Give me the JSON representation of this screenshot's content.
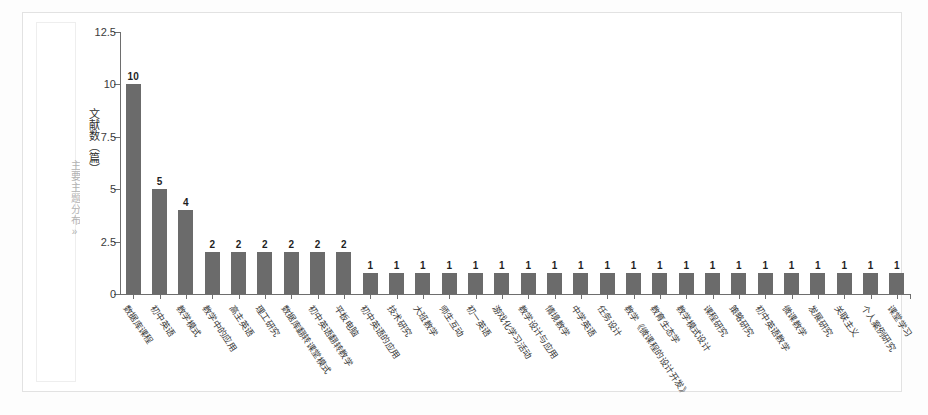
{
  "caption": {
    "side_label": "主要主题分布»"
  },
  "chart_data": {
    "type": "bar",
    "title": "",
    "xlabel": "",
    "ylabel": "文献数（篇）",
    "ylim": [
      0,
      12.5
    ],
    "ytick_labels": [
      "0",
      "2.5",
      "5",
      "7.5",
      "10",
      "12.5"
    ],
    "ytick_values": [
      0,
      2.5,
      5,
      7.5,
      10,
      12.5
    ],
    "grid": false,
    "legend": "none",
    "categories": [
      "数据库课程",
      "初中英语",
      "教学模式",
      "教学中的应用",
      "高主英语",
      "理工研究",
      "数据库翻转课堂模式",
      "初中英语翻转教学",
      "平板电脑",
      "初中英语的应用",
      "技术研究",
      "大班教学",
      "师生互动",
      "初一英语",
      "游戏化学习活动",
      "教学设计与应用",
      "情境教学",
      "中学英语",
      "任务设计",
      "教学《微课程的设计开发》",
      "教育生态学",
      "教学模式设计",
      "课程研究",
      "策略研究",
      "初中英语教学",
      "微课教学",
      "发展研究",
      "关联主义",
      "个人案例研究",
      "课堂学习"
    ],
    "values": [
      10,
      5,
      4,
      2,
      2,
      2,
      2,
      2,
      2,
      1,
      1,
      1,
      1,
      1,
      1,
      1,
      1,
      1,
      1,
      1,
      1,
      1,
      1,
      1,
      1,
      1,
      1,
      1,
      1,
      1
    ],
    "bar_color": "#6b6b6b",
    "axis_color": "#6e6e6e"
  }
}
